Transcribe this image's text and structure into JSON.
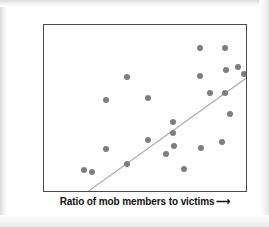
{
  "chart_data": {
    "type": "scatter",
    "title": "",
    "xlabel": "Ratio of mob members to victims",
    "ylabel": "Level of Atrocity",
    "xlabel_arrow": "⟶",
    "ylabel_arrow": "⟶",
    "grid": false,
    "legend": null,
    "axis_ticks": false,
    "xlim": [
      0,
      1
    ],
    "ylim": [
      0,
      1
    ],
    "point_color": "#7e7e7e",
    "line_color": "#a9a9a9",
    "frame_color": "#4a4a4a",
    "points": [
      {
        "x": 0.196,
        "y": 0.137
      },
      {
        "x": 0.304,
        "y": 0.554
      },
      {
        "x": 0.304,
        "y": 0.262
      },
      {
        "x": 0.407,
        "y": 0.173
      },
      {
        "x": 0.51,
        "y": 0.565
      },
      {
        "x": 0.51,
        "y": 0.315
      },
      {
        "x": 0.598,
        "y": 0.232
      },
      {
        "x": 0.632,
        "y": 0.423
      },
      {
        "x": 0.632,
        "y": 0.357
      },
      {
        "x": 0.637,
        "y": 0.28
      },
      {
        "x": 0.686,
        "y": 0.143
      },
      {
        "x": 0.765,
        "y": 0.863
      },
      {
        "x": 0.765,
        "y": 0.696
      },
      {
        "x": 0.77,
        "y": 0.268
      },
      {
        "x": 0.814,
        "y": 0.595
      },
      {
        "x": 0.873,
        "y": 0.304
      },
      {
        "x": 0.887,
        "y": 0.595
      },
      {
        "x": 0.887,
        "y": 0.863
      },
      {
        "x": 0.892,
        "y": 0.732
      },
      {
        "x": 0.912,
        "y": 0.47
      },
      {
        "x": 0.951,
        "y": 0.75
      },
      {
        "x": 0.98,
        "y": 0.708
      },
      {
        "x": 0.407,
        "y": 0.69
      },
      {
        "x": 0.235,
        "y": 0.125
      }
    ],
    "trend_line": {
      "x0": 0.221,
      "y0": 0.0,
      "x1": 1.0,
      "y1": 0.679
    }
  }
}
